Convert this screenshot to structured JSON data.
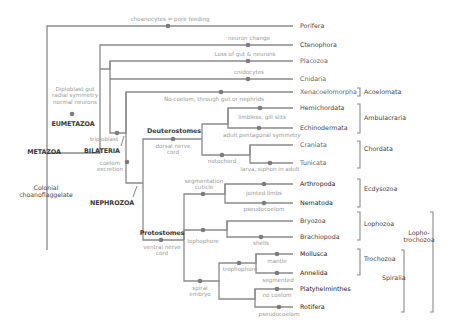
{
  "diagram": {
    "type": "phylogenetic-tree",
    "taxa": [
      {
        "name": "Porifera"
      },
      {
        "name": "Ctenophora"
      },
      {
        "name": "Placozoa"
      },
      {
        "name": "Cnidaria"
      },
      {
        "name": "Xenacoelomorpha"
      },
      {
        "name": "Hemichordata"
      },
      {
        "name": "Echinodermata"
      },
      {
        "name": "Craniata"
      },
      {
        "name": "Tunicata"
      },
      {
        "name": "Arthropoda"
      },
      {
        "name": "Nematoda"
      },
      {
        "name": "Bryozoa"
      },
      {
        "name": "Brachiopoda"
      },
      {
        "name": "Mollusca"
      },
      {
        "name": "Annelida"
      },
      {
        "name": "Platyhelminthes"
      },
      {
        "name": "Rotifera"
      }
    ],
    "characters": {
      "choanocytes": "choanocytes = pore feeding",
      "neuron_change": "neuron change",
      "loss_gut": "Loss of gut & neurons",
      "cnidocytes": "cnidocytes",
      "no_coelom": "No coelom, through gut or nephrids",
      "diploblast": [
        "Diploblast gut",
        "radial symmetry",
        "normal neurons"
      ],
      "triploblast": "triploblast",
      "coelom": [
        "coelom",
        "excretion"
      ],
      "dorsal_nerve": [
        "dorsal nerve",
        "cord"
      ],
      "limbless": "limbless, gill slits",
      "pentagonal": "adult pentagonal symmetry",
      "notochord": "notochord",
      "larva": "larva, siphon in adult",
      "segmentation": [
        "segmentation",
        "cuticle"
      ],
      "jointed": "jointed limbs",
      "pseudocoelom1": "pseudocoelom",
      "lophophore": "lophophore",
      "shells": "shells",
      "ventral_nerve": [
        "ventral nerve",
        "cord"
      ],
      "spiral": [
        "spiral",
        "embryo"
      ],
      "trophophore": "trophophore",
      "mantle": "mantle",
      "segmented": "segmented",
      "no_coelom2": "no coelom",
      "pseudocoelom2": "pseudocoelom"
    },
    "clades": {
      "metazoa": "METAZOA",
      "eumetazoa": "EUMETAZOA",
      "bilateria": "BILATERIA",
      "nephrozoa": "NEPHROZOA",
      "deuterostomes": "Deuterostomes",
      "protostomes": "Protostomes",
      "root": [
        "Colonial",
        "choanoflaggelate"
      ]
    },
    "groups": {
      "acoelomata": "Acoelomata",
      "ambulacraria": "Ambulacraria",
      "chordata": "Chordata",
      "ecdysozoa": "Ecdysozoa",
      "lophozoa": "Lophozoa",
      "trochozoa": "Trochozoa",
      "spiralia": "Spiralia",
      "lophotrochozoa": [
        "Lopho-",
        "trochozoa"
      ]
    }
  }
}
